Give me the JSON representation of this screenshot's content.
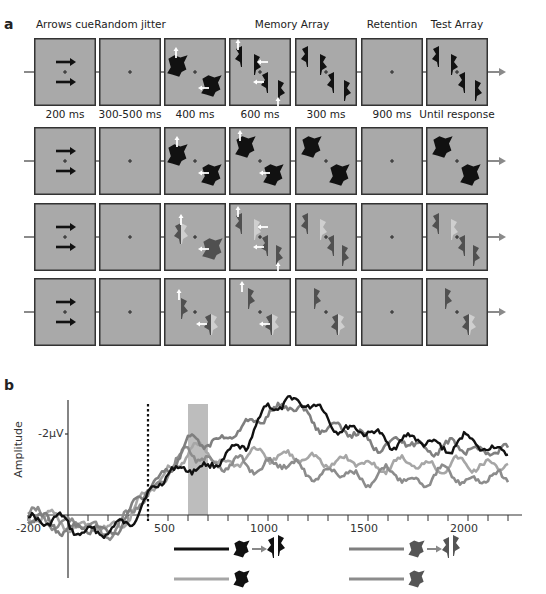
{
  "panel_a": {
    "label": "a",
    "stage_titles": [
      "Arrows cue",
      "Random jitter",
      "",
      "Memory Array",
      "",
      "Retention",
      "Test Array"
    ],
    "durations": [
      "200 ms",
      "300-500 ms",
      "400 ms",
      "600 ms",
      "300 ms",
      "900 ms",
      "Until response"
    ],
    "rows": [
      {
        "name": "row-1",
        "shape_color": "#111111",
        "condition": "black shapes, both cued, test contains changed item"
      },
      {
        "name": "row-2",
        "shape_color": "#111111",
        "condition": "black blobs, test same"
      },
      {
        "name": "row-3",
        "shape_color": "#555555",
        "condition": "dark gray shapes with light distractor"
      },
      {
        "name": "row-4",
        "shape_color": "#555555",
        "condition": "dark gray shapes with light distractor, test same"
      }
    ],
    "panel_bg": "#a9a9a9",
    "cue_color": "#111111",
    "arrow_color": "#ffffff"
  },
  "panel_b": {
    "label": "b",
    "ylabel": "Amplitude",
    "ytick": "-2µV",
    "xticks": [
      "-200",
      "500",
      "1000",
      "1500",
      "2000"
    ]
  },
  "chart_data": {
    "type": "line",
    "title": "",
    "xlabel": "",
    "ylabel": "Amplitude",
    "xlim": [
      -200,
      2200
    ],
    "ylim_uV": [
      0.7,
      -3.2
    ],
    "y_inverted": true,
    "ytick_labels": [
      "-2µV"
    ],
    "xtick_labels": [
      "-200",
      "500",
      "1000",
      "1500",
      "2000"
    ],
    "annotations": [
      {
        "type": "vline_dotted",
        "x": 400
      },
      {
        "type": "shaded_span",
        "x0": 600,
        "x1": 700,
        "color": "#bdbdbd"
      }
    ],
    "x": [
      -200,
      -100,
      0,
      100,
      200,
      300,
      400,
      500,
      600,
      700,
      800,
      900,
      1000,
      1100,
      1200,
      1300,
      1400,
      1500,
      1600,
      1700,
      1800,
      1900,
      2000,
      2100,
      2200
    ],
    "series": [
      {
        "name": "black shapes, change (black → black)",
        "color": "#111111",
        "values": [
          0.0,
          0.2,
          0.2,
          0.4,
          0.5,
          0.1,
          -0.4,
          -1.0,
          -1.3,
          -1.0,
          -1.6,
          -1.8,
          -2.6,
          -2.9,
          -2.7,
          -2.4,
          -2.1,
          -2.0,
          -1.9,
          -1.8,
          -1.8,
          -1.7,
          -1.8,
          -1.7,
          -1.6
        ]
      },
      {
        "name": "black shapes, no change",
        "color": "#a6a6a6",
        "values": [
          0.1,
          0.1,
          0.2,
          0.3,
          0.4,
          0.0,
          -0.5,
          -1.1,
          -1.6,
          -1.5,
          -1.3,
          -1.4,
          -1.5,
          -1.5,
          -1.3,
          -1.4,
          -1.3,
          -1.2,
          -1.3,
          -1.2,
          -1.3,
          -1.2,
          -1.2,
          -1.3,
          -1.2
        ]
      },
      {
        "name": "gray shapes, change (gray → gray)",
        "color": "#7f7f7f",
        "values": [
          0.1,
          0.2,
          0.3,
          0.4,
          0.4,
          0.0,
          -0.6,
          -1.2,
          -1.7,
          -1.8,
          -2.0,
          -2.1,
          -2.6,
          -2.7,
          -2.4,
          -2.2,
          -2.0,
          -1.9,
          -1.7,
          -1.8,
          -1.7,
          -1.6,
          -1.7,
          -1.6,
          -1.5
        ]
      },
      {
        "name": "gray shapes, no change",
        "color": "#8c8c8c",
        "values": [
          0.0,
          0.1,
          0.2,
          0.3,
          0.4,
          0.1,
          -0.5,
          -1.1,
          -1.5,
          -1.4,
          -1.2,
          -1.2,
          -1.3,
          -1.2,
          -1.1,
          -1.0,
          -1.0,
          -0.9,
          -1.0,
          -0.9,
          -0.9,
          -1.0,
          -0.9,
          -0.9,
          -0.8
        ]
      }
    ],
    "legend": [
      {
        "color": "#111111",
        "glyph": "black blob → black split shape"
      },
      {
        "color": "#a6a6a6",
        "glyph": "black blob"
      },
      {
        "color": "#7f7f7f",
        "glyph": "gray blob → gray split shape"
      },
      {
        "color": "#8c8c8c",
        "glyph": "gray blob"
      }
    ],
    "legend_position": "below plot",
    "grid": false
  }
}
